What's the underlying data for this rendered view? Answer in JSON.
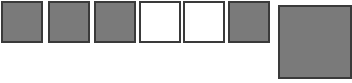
{
  "canvas": {
    "width": 352,
    "height": 83,
    "background_color": "#ffffff"
  },
  "palette": {
    "gray_fill": "#7a7a7a",
    "white_fill": "#ffffff",
    "border_dark": "#3a3a3a",
    "border_gray": "#4a4a4a"
  },
  "swatches": [
    {
      "index": 1,
      "name": "swatch-1",
      "fill": "#7a7a7a",
      "border_color": "#3a3a3a",
      "border_width": 2,
      "x": 1,
      "y": 1,
      "width": 42,
      "height": 42
    },
    {
      "index": 2,
      "name": "swatch-2",
      "fill": "#7a7a7a",
      "border_color": "#3a3a3a",
      "border_width": 2,
      "x": 48,
      "y": 1,
      "width": 42,
      "height": 42
    },
    {
      "index": 3,
      "name": "swatch-3",
      "fill": "#7a7a7a",
      "border_color": "#3a3a3a",
      "border_width": 2,
      "x": 94,
      "y": 1,
      "width": 42,
      "height": 42
    },
    {
      "index": 4,
      "name": "swatch-4",
      "fill": "#ffffff",
      "border_color": "#3a3a3a",
      "border_width": 2,
      "x": 139,
      "y": 1,
      "width": 42,
      "height": 42
    },
    {
      "index": 5,
      "name": "swatch-5",
      "fill": "#ffffff",
      "border_color": "#3a3a3a",
      "border_width": 2,
      "x": 183,
      "y": 1,
      "width": 42,
      "height": 42
    },
    {
      "index": 6,
      "name": "swatch-6",
      "fill": "#7a7a7a",
      "border_color": "#3a3a3a",
      "border_width": 2,
      "x": 228,
      "y": 1,
      "width": 42,
      "height": 42
    },
    {
      "index": 7,
      "name": "swatch-7-large",
      "fill": "#7a7a7a",
      "border_color": "#3a3a3a",
      "border_width": 2,
      "x": 278,
      "y": 5,
      "width": 74,
      "height": 74
    }
  ]
}
